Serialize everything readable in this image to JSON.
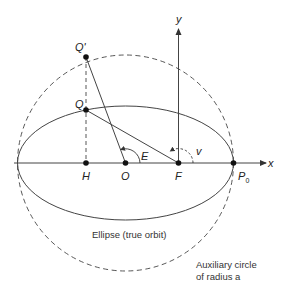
{
  "diagram": {
    "points": {
      "Q_prime": "Q'",
      "Q": "Q",
      "H": "H",
      "O": "O",
      "F": "F",
      "P0_main": "P",
      "P0_sub": "0"
    },
    "axes": {
      "x": "x",
      "y": "y"
    },
    "angles": {
      "eccentric_anomaly": "E",
      "true_anomaly": "v"
    },
    "captions": {
      "ellipse": "Ellipse (true orbit)",
      "circle_line1": "Auxiliary circle",
      "circle_line2": "of radius a"
    },
    "colors": {
      "stroke": "#3a3a3a",
      "background": "#ffffff"
    }
  }
}
